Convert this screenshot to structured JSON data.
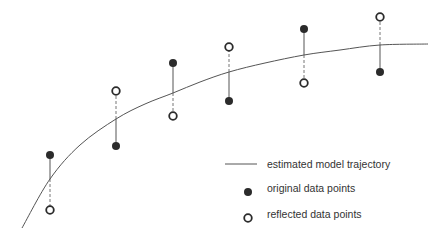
{
  "diagram": {
    "type": "reflected-data-points-illustration",
    "curve": {
      "label": "estimated model trajectory",
      "color": "#555555",
      "path_points": [
        [
          22,
          228
        ],
        [
          50,
          179
        ],
        [
          80,
          145
        ],
        [
          116,
          119
        ],
        [
          145,
          104
        ],
        [
          173,
          93
        ],
        [
          200,
          82
        ],
        [
          229,
          72
        ],
        [
          265,
          63
        ],
        [
          304,
          55
        ],
        [
          340,
          50
        ],
        [
          380,
          45
        ],
        [
          428,
          44
        ]
      ]
    },
    "pairs": [
      {
        "x": 50,
        "original_y": 155,
        "curve_y": 179,
        "reflected_y": 210
      },
      {
        "x": 116,
        "original_y": 146,
        "curve_y": 119,
        "reflected_y": 91
      },
      {
        "x": 173,
        "original_y": 63,
        "curve_y": 93,
        "reflected_y": 116
      },
      {
        "x": 229,
        "original_y": 101,
        "curve_y": 72,
        "reflected_y": 47
      },
      {
        "x": 304,
        "original_y": 29,
        "curve_y": 55,
        "reflected_y": 83
      },
      {
        "x": 380,
        "original_y": 72,
        "curve_y": 45,
        "reflected_y": 17
      }
    ],
    "colors": {
      "point_fill": "#2b2b2b",
      "segment_solid": "#555555",
      "segment_dashed": "#777777",
      "text": "#333333"
    }
  },
  "legend": {
    "items": [
      {
        "icon": "line-icon",
        "label": "estimated model trajectory"
      },
      {
        "icon": "filled-circle-icon",
        "label": "original data points"
      },
      {
        "icon": "hollow-circle-icon",
        "label": "reflected data points"
      }
    ]
  }
}
